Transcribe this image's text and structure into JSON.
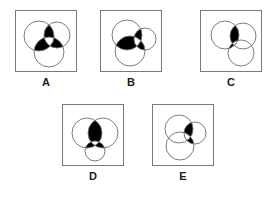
{
  "puzzle": {
    "type": "venn-diagram-multiple-choice",
    "background_color": "#ffffff",
    "frame_border_color": "#7a7a7a",
    "circle_stroke_color": "#6e6e6e",
    "shaded_color": "#000000",
    "unshaded_color": "#ffffff",
    "options": [
      {
        "id": "A",
        "label": "A",
        "circle_count": 3,
        "circles": [
          {
            "name": "upper-left-circle",
            "cx": 23,
            "cy": 25,
            "r": 15
          },
          {
            "name": "upper-right-circle",
            "cx": 41,
            "cy": 24,
            "r": 13
          },
          {
            "name": "lower-circle",
            "cx": 33,
            "cy": 41,
            "r": 15
          }
        ],
        "shaded_regions": [
          "pairwise-overlaps"
        ],
        "white_center": true,
        "description": "Three overlapping circles with all pairwise lens overlaps filled black and the common triple-overlap center left white"
      },
      {
        "id": "B",
        "label": "B",
        "circle_count": 3,
        "circles": [
          {
            "name": "upper-left-circle",
            "cx": 26,
            "cy": 24,
            "r": 15
          },
          {
            "name": "right-circle",
            "cx": 44,
            "cy": 28,
            "r": 11
          },
          {
            "name": "lower-circle",
            "cx": 29,
            "cy": 40,
            "r": 15
          }
        ],
        "shaded_regions": [
          "pairwise-overlaps"
        ],
        "white_center": true,
        "description": "Two large circles plus a smaller right circle; pairwise overlaps shaded black with white triple-overlap center"
      },
      {
        "id": "C",
        "label": "C",
        "circle_count": 3,
        "circles": [
          {
            "name": "upper-left-circle",
            "cx": 24,
            "cy": 24,
            "r": 14
          },
          {
            "name": "upper-right-circle",
            "cx": 42,
            "cy": 25,
            "r": 13
          },
          {
            "name": "lower-right-circle",
            "cx": 40,
            "cy": 42,
            "r": 13
          }
        ],
        "shaded_regions": [
          "single-central-lens"
        ],
        "white_center": true,
        "description": "Three circles with only the central lens region shaded black, split by a thin white diagonal sliver"
      },
      {
        "id": "D",
        "label": "D",
        "circle_count": 3,
        "circles": [
          {
            "name": "left-circle",
            "cx": 24,
            "cy": 28,
            "r": 15
          },
          {
            "name": "right-circle",
            "cx": 40,
            "cy": 28,
            "r": 15
          },
          {
            "name": "bottom-small-circle",
            "cx": 32,
            "cy": 46,
            "r": 10
          }
        ],
        "shaded_regions": [
          "pairwise-overlaps"
        ],
        "white_center": true,
        "description": "Two large side-by-side circles and a small bottom circle; pairwise overlaps black with white triangular center"
      },
      {
        "id": "E",
        "label": "E",
        "circle_count": 3,
        "circles": [
          {
            "name": "upper-left-circle",
            "cx": 26,
            "cy": 24,
            "r": 14
          },
          {
            "name": "right-circle",
            "cx": 42,
            "cy": 28,
            "r": 11
          },
          {
            "name": "lower-left-circle",
            "cx": 27,
            "cy": 41,
            "r": 14
          }
        ],
        "shaded_regions": [
          "right-circle-overlaps"
        ],
        "white_center": true,
        "description": "Three circles where only the small right circle's overlap wedges are shaded black"
      }
    ]
  }
}
